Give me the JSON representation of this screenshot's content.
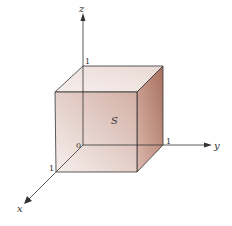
{
  "diagram": {
    "type": "unit-cube-3d-axes",
    "axes": {
      "x": {
        "label": "x",
        "tick": "1"
      },
      "y": {
        "label": "y",
        "tick": "1"
      },
      "z": {
        "label": "z",
        "tick": "1"
      }
    },
    "origin_label": "0",
    "surface_label": "S",
    "colors": {
      "line": "#333333",
      "front_face_dark": "#cfa99e",
      "front_face_light": "#f3ebe8",
      "right_face_dark": "#a8705e",
      "right_face_light": "#d9b3a8",
      "top_face": "#f1e6e3"
    }
  }
}
